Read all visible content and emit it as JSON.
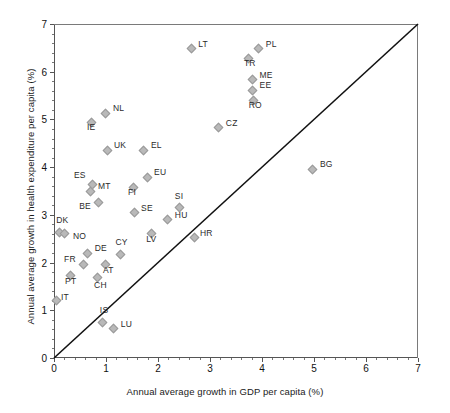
{
  "chart_data": {
    "type": "scatter",
    "title": "",
    "xlabel": "Annual average growth in GDP per capita (%)",
    "ylabel": "Annual average growth in health expenditure per capita (%)",
    "xlim": [
      0,
      7
    ],
    "ylim": [
      0,
      7
    ],
    "xticks": [
      "0",
      "1",
      "2",
      "3",
      "4",
      "5",
      "6",
      "7"
    ],
    "yticks": [
      "0",
      "1",
      "2",
      "3",
      "4",
      "5",
      "6",
      "7"
    ],
    "grid": false,
    "legend": "none",
    "annotations": [
      {
        "name": "diagonal-line",
        "description": "45 degree reference line from (0,0) to (7,7)"
      }
    ],
    "marker": {
      "shape": "diamond",
      "color": "#b9b9b9",
      "edge_color": "#9a9a9a"
    },
    "points": [
      {
        "label": "LT",
        "x": 2.62,
        "y": 6.5,
        "lx": 8,
        "ly": -4
      },
      {
        "label": "PL",
        "x": 3.92,
        "y": 6.5,
        "lx": 8,
        "ly": -4
      },
      {
        "label": "TR",
        "x": 3.73,
        "y": 6.3,
        "lx": -4,
        "ly": 6
      },
      {
        "label": "ME",
        "x": 3.8,
        "y": 5.85,
        "lx": 8,
        "ly": -4
      },
      {
        "label": "EE",
        "x": 3.8,
        "y": 5.63,
        "lx": 8,
        "ly": -4
      },
      {
        "label": "RO",
        "x": 3.82,
        "y": 5.42,
        "lx": -4,
        "ly": 6
      },
      {
        "label": "NL",
        "x": 0.98,
        "y": 5.15,
        "lx": 8,
        "ly": -4
      },
      {
        "label": "IE",
        "x": 0.71,
        "y": 4.96,
        "lx": -4,
        "ly": 6
      },
      {
        "label": "CZ",
        "x": 3.15,
        "y": 4.85,
        "lx": 8,
        "ly": -4
      },
      {
        "label": "UK",
        "x": 1.0,
        "y": 4.38,
        "lx": 8,
        "ly": -4
      },
      {
        "label": "EL",
        "x": 1.71,
        "y": 4.38,
        "lx": 8,
        "ly": -4
      },
      {
        "label": "BG",
        "x": 4.96,
        "y": 3.98,
        "lx": 8,
        "ly": -4
      },
      {
        "label": "EU",
        "x": 1.77,
        "y": 3.81,
        "lx": 8,
        "ly": -4
      },
      {
        "label": "ES",
        "x": 0.73,
        "y": 3.65,
        "lx": -18,
        "ly": -9
      },
      {
        "label": "MT",
        "x": 0.69,
        "y": 3.52,
        "lx": 8,
        "ly": -4
      },
      {
        "label": "FI",
        "x": 1.5,
        "y": 3.6,
        "lx": -4,
        "ly": 6
      },
      {
        "label": "SI",
        "x": 2.4,
        "y": 3.17,
        "lx": -4,
        "ly": -11
      },
      {
        "label": "BE",
        "x": 0.83,
        "y": 3.27,
        "lx": -18,
        "ly": 4
      },
      {
        "label": "SE",
        "x": 1.52,
        "y": 3.06,
        "lx": 8,
        "ly": -4
      },
      {
        "label": "HU",
        "x": 2.17,
        "y": 2.92,
        "lx": 8,
        "ly": -4
      },
      {
        "label": "DK",
        "x": 0.08,
        "y": 2.65,
        "lx": -2,
        "ly": -12
      },
      {
        "label": "LV",
        "x": 1.85,
        "y": 2.62,
        "lx": -4,
        "ly": 6
      },
      {
        "label": "HR",
        "x": 2.69,
        "y": 2.55,
        "lx": 6,
        "ly": -3
      },
      {
        "label": "NO",
        "x": 0.19,
        "y": 2.62,
        "lx": 9,
        "ly": 3
      },
      {
        "label": "DE",
        "x": 0.63,
        "y": 2.22,
        "lx": 8,
        "ly": -4
      },
      {
        "label": "CY",
        "x": 1.26,
        "y": 2.2,
        "lx": -4,
        "ly": -11
      },
      {
        "label": "FR",
        "x": 0.54,
        "y": 1.98,
        "lx": -18,
        "ly": -5
      },
      {
        "label": "AT",
        "x": 0.98,
        "y": 1.98,
        "lx": -2,
        "ly": 6
      },
      {
        "label": "CH",
        "x": 0.81,
        "y": 1.7,
        "lx": -2,
        "ly": 8
      },
      {
        "label": "PT",
        "x": 0.29,
        "y": 1.75,
        "lx": -4,
        "ly": 6
      },
      {
        "label": "IT",
        "x": 0.02,
        "y": 1.22,
        "lx": 6,
        "ly": -3
      },
      {
        "label": "IS",
        "x": 0.92,
        "y": 0.77,
        "lx": -2,
        "ly": -11
      },
      {
        "label": "LU",
        "x": 1.13,
        "y": 0.63,
        "lx": 8,
        "ly": -4
      }
    ]
  }
}
